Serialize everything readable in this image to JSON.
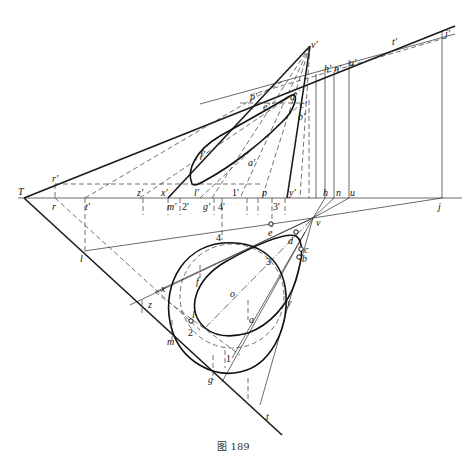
{
  "figure": {
    "caption": "图 189"
  },
  "labels": {
    "T": "T",
    "r_prime": "r'",
    "r": "r",
    "t_prime_axis": "t'",
    "z_prime": "z'",
    "x_prime": "x'",
    "m_prime": "m'",
    "two_prime": "2'",
    "g_prime": "g'",
    "four_prime": "4'",
    "one_prime": "1'",
    "p": "p",
    "three_prime": "3'",
    "y_prime": "y'",
    "h": "h",
    "n": "n",
    "u": "u",
    "j": "j",
    "v_prime": "v'",
    "j_prime": "j'",
    "t_prime": "t'",
    "h_prime": "h'",
    "n_prime": "n'",
    "u_prime": "u'",
    "p_prime": "p'",
    "e_prime": "e'",
    "d_prime": "d'",
    "c_prime": "c'",
    "b_prime": "b'",
    "f_prime": "f'",
    "l_prime": "l'",
    "a_prime": "a'",
    "v": "v",
    "e": "e",
    "d": "d",
    "c": "c",
    "b": "b",
    "four": "4",
    "three": "3",
    "f": "f",
    "o": "o",
    "x": "x",
    "z": "z",
    "l": "l",
    "two": "2",
    "a": "a",
    "y": "y",
    "m": "m",
    "one": "1",
    "g": "g",
    "t": "t",
    "l_left": "l"
  }
}
